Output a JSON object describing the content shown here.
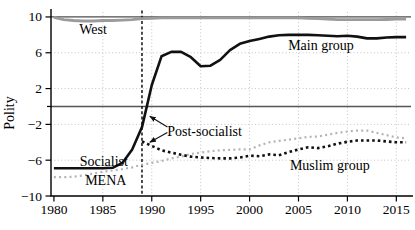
{
  "chart_data": {
    "type": "line",
    "title": "",
    "xlabel": "",
    "ylabel": "Polity",
    "xlim": [
      1979.7,
      2016.5
    ],
    "ylim": [
      -10,
      11
    ],
    "x_ticks": [
      1980,
      1985,
      1990,
      1995,
      2000,
      2005,
      2010,
      2015
    ],
    "y_ticks": [
      {
        "value": 10,
        "label": "10"
      },
      {
        "value": 6,
        "label": "6"
      },
      {
        "value": 2,
        "label": "2"
      },
      {
        "value": -2,
        "label": "−2"
      },
      {
        "value": -6,
        "label": "−6"
      },
      {
        "value": -10,
        "label": "−10"
      }
    ],
    "y_minor_ticks": [
      0
    ],
    "grid": "light dotted gridlines at ticks",
    "grid_y": [
      6,
      2,
      -2,
      -6
    ],
    "legend_position": "none (inline text labels on lines)",
    "colors": {
      "axis": "#000000",
      "grid": "#c4c4c4",
      "west_line": "#9b9b9b",
      "mena_line": "#b4b4b4",
      "black_line": "#111111",
      "reference_line": "#4d4d4d"
    },
    "reference_lines": [
      {
        "axis": "y",
        "value": 10,
        "style": "solid",
        "color": "#4d4d4d",
        "width": 1.2
      },
      {
        "axis": "y",
        "value": 0,
        "style": "solid",
        "color": "#555555",
        "width": 1.5
      },
      {
        "axis": "x",
        "value": 1989,
        "style": "dashed",
        "color": "#111111",
        "width": 1.5
      }
    ],
    "series": [
      {
        "id": "west",
        "name": "West",
        "style": "solid",
        "color": "#9b9b9b",
        "width": 2.8,
        "dash": "",
        "points": [
          [
            1980,
            9.95
          ],
          [
            1981,
            9.7
          ],
          [
            1982,
            9.6
          ],
          [
            1983,
            9.55
          ],
          [
            1984,
            9.55
          ],
          [
            1985,
            9.6
          ],
          [
            1986,
            9.6
          ],
          [
            1987,
            9.65
          ],
          [
            1988,
            9.7
          ],
          [
            1989,
            9.8
          ],
          [
            1990,
            9.85
          ],
          [
            1991,
            9.9
          ],
          [
            1992,
            9.9
          ],
          [
            1993,
            9.9
          ],
          [
            1994,
            9.9
          ],
          [
            1995,
            9.9
          ],
          [
            1996,
            9.9
          ],
          [
            1997,
            9.9
          ],
          [
            1998,
            9.9
          ],
          [
            1999,
            9.9
          ],
          [
            2000,
            9.9
          ],
          [
            2001,
            9.9
          ],
          [
            2002,
            9.9
          ],
          [
            2003,
            9.9
          ],
          [
            2004,
            9.9
          ],
          [
            2005,
            9.9
          ],
          [
            2006,
            9.85
          ],
          [
            2007,
            9.8
          ],
          [
            2008,
            9.75
          ],
          [
            2009,
            9.7
          ],
          [
            2010,
            9.7
          ],
          [
            2011,
            9.7
          ],
          [
            2012,
            9.7
          ],
          [
            2013,
            9.7
          ],
          [
            2014,
            9.72
          ],
          [
            2015,
            9.75
          ],
          [
            2016,
            9.75
          ]
        ]
      },
      {
        "id": "main-group",
        "name": "Main group (Socialist before 1989)",
        "style": "solid",
        "color": "#111111",
        "width": 2.6,
        "dash": "",
        "points": [
          [
            1980,
            -6.9
          ],
          [
            1981,
            -6.9
          ],
          [
            1982,
            -6.9
          ],
          [
            1983,
            -6.9
          ],
          [
            1984,
            -6.9
          ],
          [
            1985,
            -6.9
          ],
          [
            1986,
            -6.85
          ],
          [
            1987,
            -6.3
          ],
          [
            1988,
            -4.8
          ],
          [
            1989,
            -2.3
          ],
          [
            1990,
            2.4
          ],
          [
            1991,
            5.6
          ],
          [
            1992,
            6.1
          ],
          [
            1993,
            6.1
          ],
          [
            1994,
            5.5
          ],
          [
            1995,
            4.5
          ],
          [
            1996,
            4.55
          ],
          [
            1997,
            5.2
          ],
          [
            1998,
            6.3
          ],
          [
            1999,
            7.0
          ],
          [
            2000,
            7.3
          ],
          [
            2001,
            7.55
          ],
          [
            2002,
            7.8
          ],
          [
            2003,
            7.95
          ],
          [
            2004,
            8.0
          ],
          [
            2005,
            8.0
          ],
          [
            2006,
            8.0
          ],
          [
            2007,
            7.95
          ],
          [
            2008,
            7.9
          ],
          [
            2009,
            7.85
          ],
          [
            2010,
            7.9
          ],
          [
            2011,
            7.8
          ],
          [
            2012,
            7.6
          ],
          [
            2013,
            7.6
          ],
          [
            2014,
            7.7
          ],
          [
            2015,
            7.75
          ],
          [
            2016,
            7.75
          ]
        ]
      },
      {
        "id": "muslim-group",
        "name": "Muslim group",
        "style": "dotted",
        "color": "#111111",
        "width": 2.6,
        "dash": "2.6 3",
        "points": [
          [
            1989,
            -3.9
          ],
          [
            1990,
            -4.4
          ],
          [
            1991,
            -4.9
          ],
          [
            1992,
            -5.15
          ],
          [
            1993,
            -5.4
          ],
          [
            1994,
            -5.6
          ],
          [
            1995,
            -5.7
          ],
          [
            1996,
            -5.75
          ],
          [
            1997,
            -5.8
          ],
          [
            1998,
            -5.8
          ],
          [
            1999,
            -5.7
          ],
          [
            2000,
            -5.5
          ],
          [
            2001,
            -5.55
          ],
          [
            2002,
            -5.35
          ],
          [
            2003,
            -5.45
          ],
          [
            2004,
            -5.1
          ],
          [
            2005,
            -4.8
          ],
          [
            2006,
            -4.55
          ],
          [
            2007,
            -4.65
          ],
          [
            2008,
            -4.45
          ],
          [
            2009,
            -4.15
          ],
          [
            2010,
            -3.95
          ],
          [
            2011,
            -3.8
          ],
          [
            2012,
            -3.8
          ],
          [
            2013,
            -3.8
          ],
          [
            2014,
            -3.9
          ],
          [
            2015,
            -4.0
          ],
          [
            2016,
            -4.0
          ]
        ]
      },
      {
        "id": "mena",
        "name": "MENA",
        "style": "dotted",
        "color": "#b4b4b4",
        "width": 2.2,
        "dash": "2 3.2",
        "points": [
          [
            1980,
            -7.9
          ],
          [
            1981,
            -7.9
          ],
          [
            1982,
            -7.85
          ],
          [
            1983,
            -7.7
          ],
          [
            1984,
            -7.5
          ],
          [
            1985,
            -7.3
          ],
          [
            1986,
            -7.15
          ],
          [
            1987,
            -7.0
          ],
          [
            1988,
            -6.8
          ],
          [
            1989,
            -6.5
          ],
          [
            1990,
            -6.3
          ],
          [
            1991,
            -6.1
          ],
          [
            1992,
            -5.8
          ],
          [
            1993,
            -5.6
          ],
          [
            1994,
            -5.3
          ],
          [
            1995,
            -5.15
          ],
          [
            1996,
            -5.0
          ],
          [
            1997,
            -4.9
          ],
          [
            1998,
            -4.85
          ],
          [
            1999,
            -4.8
          ],
          [
            2000,
            -4.8
          ],
          [
            2001,
            -4.35
          ],
          [
            2002,
            -4.0
          ],
          [
            2003,
            -3.85
          ],
          [
            2004,
            -3.7
          ],
          [
            2005,
            -3.55
          ],
          [
            2006,
            -3.4
          ],
          [
            2007,
            -3.35
          ],
          [
            2008,
            -3.15
          ],
          [
            2009,
            -2.95
          ],
          [
            2010,
            -2.8
          ],
          [
            2011,
            -2.7
          ],
          [
            2012,
            -2.7
          ],
          [
            2013,
            -2.95
          ],
          [
            2014,
            -3.2
          ],
          [
            2015,
            -3.45
          ],
          [
            2016,
            -3.55
          ]
        ]
      }
    ],
    "annotations": [
      {
        "id": "west",
        "text": "West",
        "x": 1984.0,
        "y": 8.55
      },
      {
        "id": "main-group",
        "text": "Main group",
        "x": 2007.3,
        "y": 6.8
      },
      {
        "id": "post-socialist",
        "text": "Post-socialist",
        "x": 1995.4,
        "y": -2.8
      },
      {
        "id": "socialist",
        "text": "Socialist",
        "x": 1985.1,
        "y": -6.1
      },
      {
        "id": "mena",
        "text": "MENA",
        "x": 1985.3,
        "y": -8.3
      },
      {
        "id": "muslim-group",
        "text": "Muslim group",
        "x": 2008.2,
        "y": -6.55
      }
    ],
    "arrows": [
      {
        "id": "post-socialist-to-main",
        "from": [
          1991.6,
          -2.3
        ],
        "to": [
          1989.8,
          -1.1
        ]
      },
      {
        "id": "post-socialist-to-muslim",
        "from": [
          1991.6,
          -2.9
        ],
        "to": [
          1989.8,
          -4.0
        ]
      }
    ]
  }
}
